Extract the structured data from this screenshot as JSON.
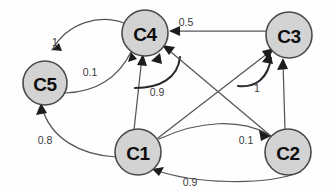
{
  "figure": {
    "kind": "directed-weighted-graph",
    "background_color": "#fefefe",
    "node_fill_color": "#d3d3d3",
    "node_stroke_color": "#4a4a4a",
    "edge_color": "#55555a",
    "label_color": "#3a3a3c",
    "width": 332,
    "height": 192
  },
  "nodes": [
    {
      "id": "C1",
      "label": "C1",
      "x": 138,
      "y": 152,
      "r": 23
    },
    {
      "id": "C2",
      "label": "C2",
      "x": 288,
      "y": 152,
      "r": 23
    },
    {
      "id": "C3",
      "label": "C3",
      "x": 289,
      "y": 35,
      "r": 23
    },
    {
      "id": "C4",
      "label": "C4",
      "x": 145,
      "y": 33,
      "r": 23
    },
    {
      "id": "C5",
      "label": "C5",
      "x": 45,
      "y": 83,
      "r": 22
    }
  ],
  "edges": [
    {
      "from": "C4",
      "to": "C5",
      "weight": "1",
      "label_x": 55,
      "label_y": 42
    },
    {
      "from": "C5",
      "to": "C4",
      "weight": "0.1",
      "label_x": 90,
      "label_y": 72
    },
    {
      "from": "C3",
      "to": "C4",
      "weight": "0.5",
      "label_x": 186,
      "label_y": 22
    },
    {
      "from": "C1",
      "to": "C4",
      "weight": "0.9",
      "label_x": 157,
      "label_y": 92
    },
    {
      "from": "C2",
      "to": "C3",
      "weight": "1",
      "label_x": 257,
      "label_y": 88
    },
    {
      "from": "C1",
      "to": "C2",
      "weight": "0.1",
      "label_x": 246,
      "label_y": 140
    },
    {
      "from": "C2",
      "to": "C1",
      "weight": "0.9",
      "label_x": 190,
      "label_y": 182
    },
    {
      "from": "C1",
      "to": "C5",
      "weight": "0.8",
      "label_x": 45,
      "label_y": 140
    },
    {
      "from": "C1",
      "to": "C3",
      "weight": "",
      "label_x": 0,
      "label_y": 0
    },
    {
      "from": "C2",
      "to": "C4",
      "weight": "",
      "label_x": 0,
      "label_y": 0
    }
  ]
}
